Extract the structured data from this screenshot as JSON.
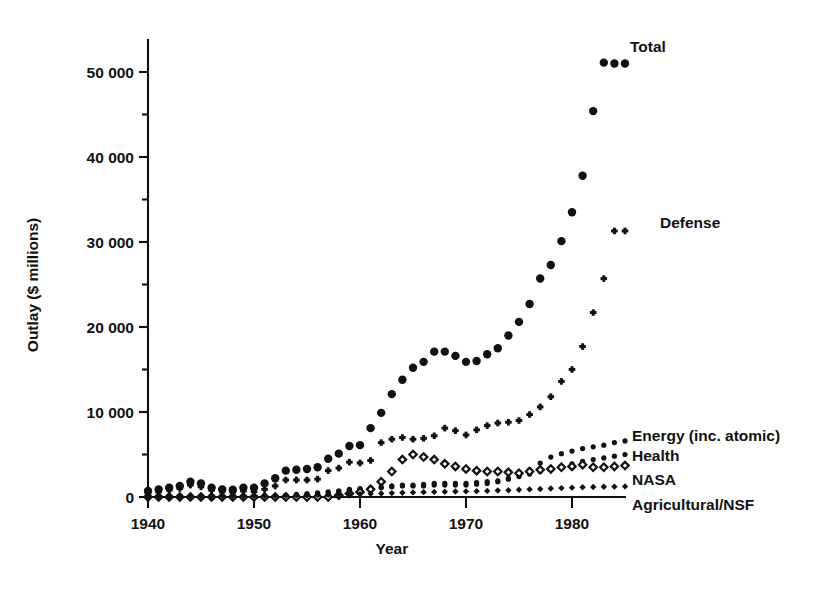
{
  "chart_data": {
    "type": "scatter",
    "title": "",
    "xlabel": "Year",
    "ylabel": "Outlay ($ millions)",
    "xlim": [
      1940,
      1986
    ],
    "ylim": [
      0,
      55000
    ],
    "xticks": [
      1940,
      1950,
      1960,
      1970,
      1980
    ],
    "xtick_labels": [
      "1940",
      "1950",
      "1960",
      "1970",
      "1980"
    ],
    "yticks": [
      0,
      10000,
      20000,
      30000,
      40000,
      50000
    ],
    "ytick_labels": [
      "0",
      "10 000",
      "20 000",
      "30 000",
      "40 000",
      "50 000"
    ],
    "yticks_minor": [
      5000,
      15000,
      25000,
      35000,
      45000,
      55000
    ],
    "grid": false,
    "legend_position": "inline-annotations",
    "x": [
      1940,
      1941,
      1942,
      1943,
      1944,
      1945,
      1946,
      1947,
      1948,
      1949,
      1950,
      1951,
      1952,
      1953,
      1954,
      1955,
      1956,
      1957,
      1958,
      1959,
      1960,
      1961,
      1962,
      1963,
      1964,
      1965,
      1966,
      1967,
      1968,
      1969,
      1970,
      1971,
      1972,
      1973,
      1974,
      1975,
      1976,
      1977,
      1978,
      1979,
      1980,
      1981,
      1982,
      1983,
      1984,
      1985
    ],
    "series": [
      {
        "name": "Total",
        "marker": "filled-circle",
        "marker_size": 8.4,
        "label_anchor": {
          "x": 1983.2,
          "y": 53600
        },
        "values": [
          700,
          900,
          1100,
          1300,
          1800,
          1600,
          1100,
          900,
          850,
          1100,
          1100,
          1600,
          2200,
          3100,
          3200,
          3300,
          3500,
          4500,
          5100,
          6000,
          6100,
          8100,
          9900,
          12100,
          13800,
          15200,
          15900,
          17100,
          17100,
          16600,
          15900,
          16000,
          16800,
          17500,
          19000,
          20600,
          22700,
          25700,
          27300,
          30100,
          33500,
          37800,
          45400,
          51100,
          51000,
          51000
        ]
      },
      {
        "name": "Defense",
        "marker": "plus",
        "marker_size": 6.6,
        "label_anchor": {
          "x": 1981.0,
          "y": 34200
        },
        "values": [
          400,
          600,
          800,
          1000,
          1400,
          1200,
          800,
          600,
          550,
          700,
          650,
          900,
          1300,
          2000,
          2000,
          2000,
          2100,
          3100,
          3400,
          4100,
          4000,
          4300,
          6400,
          6800,
          7000,
          6800,
          6900,
          7200,
          8100,
          7800,
          7300,
          7900,
          8400,
          8700,
          8800,
          9000,
          9700,
          10600,
          11800,
          13600,
          15000,
          17700,
          21700,
          25700,
          31300,
          31300
        ]
      },
      {
        "name": "Energy (inc. atomic)",
        "marker": "small-filled-circle",
        "marker_size": 5.2,
        "label_anchor": {
          "x": 1985.6,
          "y": 7200
        },
        "values": [
          0,
          0,
          0,
          0,
          0,
          0,
          0,
          0,
          0,
          0,
          0,
          0,
          0,
          200,
          300,
          400,
          500,
          600,
          700,
          800,
          900,
          1000,
          1100,
          1200,
          1300,
          1300,
          1300,
          1400,
          1400,
          1400,
          1400,
          1500,
          1600,
          1800,
          2200,
          2700,
          3200,
          4000,
          4700,
          5100,
          5400,
          5700,
          5900,
          6100,
          6400,
          6600
        ]
      },
      {
        "name": "Health",
        "marker": "small-filled-circle",
        "marker_size": 5.2,
        "label_anchor": {
          "x": 1985.6,
          "y": 5700
        },
        "values": [
          0,
          0,
          0,
          0,
          0,
          0,
          0,
          0,
          0,
          0,
          0,
          100,
          100,
          200,
          200,
          300,
          400,
          500,
          700,
          900,
          1000,
          1100,
          1200,
          1300,
          1400,
          1400,
          1500,
          1600,
          1600,
          1600,
          1600,
          1700,
          1800,
          1900,
          2100,
          2400,
          2700,
          3000,
          3300,
          3600,
          3900,
          4200,
          4400,
          4600,
          4800,
          5000
        ]
      },
      {
        "name": "NASA",
        "marker": "open-diamond",
        "marker_size": 7.4,
        "label_anchor": {
          "x": 1985.6,
          "y": 3500
        },
        "values": [
          0,
          0,
          0,
          0,
          0,
          0,
          0,
          0,
          0,
          0,
          0,
          0,
          0,
          0,
          0,
          0,
          0,
          0,
          200,
          400,
          600,
          900,
          1800,
          3000,
          4400,
          5000,
          4700,
          4400,
          3900,
          3600,
          3300,
          3100,
          3000,
          3000,
          2900,
          2800,
          3000,
          3200,
          3300,
          3500,
          3600,
          3800,
          3500,
          3500,
          3600,
          3700
        ]
      },
      {
        "name": "Agricultural/NSF",
        "marker": "filled-diamond",
        "marker_size": 6.4,
        "label_anchor": {
          "x": 1985.6,
          "y": 1200
        },
        "values": [
          30,
          40,
          50,
          60,
          70,
          80,
          90,
          100,
          110,
          120,
          130,
          140,
          150,
          170,
          190,
          210,
          230,
          250,
          280,
          310,
          340,
          380,
          420,
          460,
          500,
          540,
          570,
          600,
          620,
          640,
          660,
          690,
          720,
          760,
          800,
          850,
          900,
          950,
          1000,
          1050,
          1100,
          1150,
          1180,
          1200,
          1220,
          1250
        ]
      }
    ]
  },
  "annotations": {
    "total_label": "Total",
    "defense_label": "Defense",
    "energy_label": "Energy (inc. atomic)",
    "health_label": "Health",
    "nasa_label": "NASA",
    "agriculture_label": "Agricultural/NSF"
  }
}
